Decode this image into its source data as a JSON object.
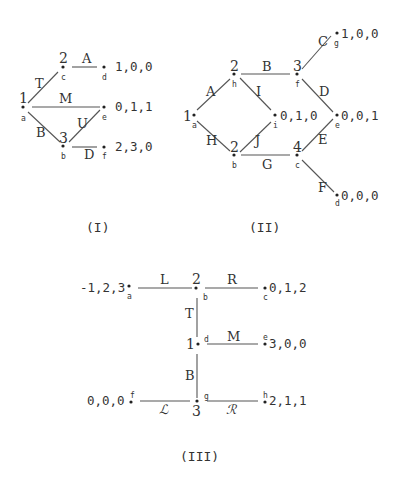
{
  "diagrams": [
    {
      "caption": "(I)",
      "nodes": {
        "a": {
          "player": "1",
          "label": "a"
        },
        "c": {
          "player": "2",
          "label": "c"
        },
        "b": {
          "player": "3",
          "label": "b"
        },
        "d": {
          "label": "d",
          "payoff": "1,0,0"
        },
        "e": {
          "label": "e",
          "payoff": "0,1,1"
        },
        "f": {
          "label": "f",
          "payoff": "2,3,0"
        }
      },
      "edges": {
        "T": "T",
        "A": "A",
        "M": "M",
        "B": "B",
        "U": "U",
        "D": "D"
      }
    },
    {
      "caption": "(II)",
      "nodes": {
        "a": {
          "player": "1",
          "label": "a"
        },
        "h": {
          "player": "2",
          "label": "h"
        },
        "b": {
          "player": "2",
          "label": "b"
        },
        "f": {
          "player": "3",
          "label": "f"
        },
        "c": {
          "player": "4",
          "label": "c"
        },
        "i": {
          "label": "i",
          "payoff": "0,1,0"
        },
        "g": {
          "label": "g",
          "payoff": "1,0,0"
        },
        "e": {
          "label": "e",
          "payoff": "0,0,1"
        },
        "d": {
          "label": "d",
          "payoff": "0,0,0"
        }
      },
      "edges": {
        "A": "A",
        "H": "H",
        "B": "B",
        "I": "I",
        "J": "J",
        "G": "G",
        "C": "C",
        "D": "D",
        "E": "E",
        "F": "F"
      }
    },
    {
      "caption": "(III)",
      "nodes": {
        "a": {
          "label": "a",
          "payoff": "-1,2,3"
        },
        "b": {
          "player": "2",
          "label": "b"
        },
        "c": {
          "label": "c",
          "payoff": "0,1,2"
        },
        "d": {
          "player": "1",
          "label": "d"
        },
        "e": {
          "label": "e",
          "payoff": "3,0,0"
        },
        "g": {
          "player": "3",
          "label": "g"
        },
        "f": {
          "label": "f",
          "payoff": "0,0,0"
        },
        "h": {
          "label": "h",
          "payoff": "2,1,1"
        }
      },
      "edges": {
        "L": "L",
        "R": "R",
        "T": "T",
        "M": "M",
        "B": "B",
        "L2": "ℒ",
        "R2": "ℛ"
      }
    }
  ]
}
